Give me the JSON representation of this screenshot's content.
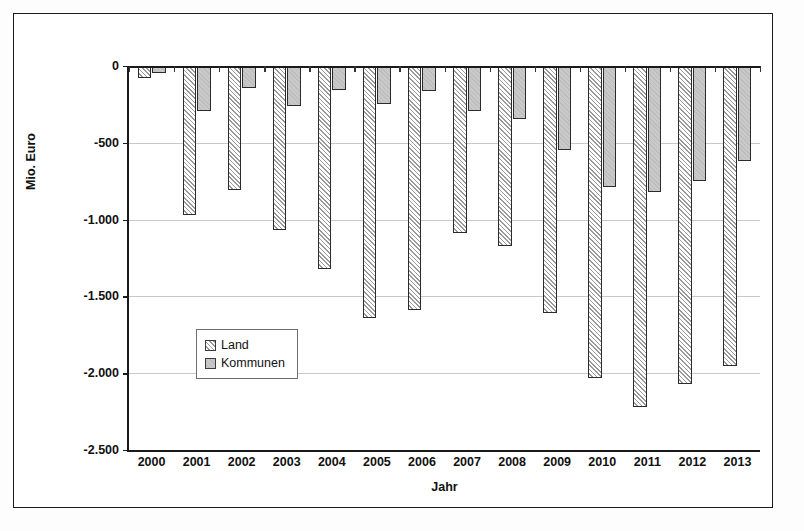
{
  "chart_data": {
    "type": "bar",
    "title": "",
    "xlabel": "Jahr",
    "ylabel": "Mio. Euro",
    "categories": [
      "2000",
      "2001",
      "2002",
      "2003",
      "2004",
      "2005",
      "2006",
      "2007",
      "2008",
      "2009",
      "2010",
      "2011",
      "2012",
      "2013"
    ],
    "series": [
      {
        "name": "Land",
        "color": "#fafafa",
        "pattern": "diagonal-hatch",
        "values": [
          -80,
          -970,
          -810,
          -1070,
          -1320,
          -1640,
          -1590,
          -1090,
          -1170,
          -1610,
          -2030,
          -2220,
          -2070,
          -1950
        ]
      },
      {
        "name": "Kommunen",
        "color": "#c8c8c8",
        "pattern": "solid-gray",
        "values": [
          -45,
          -290,
          -140,
          -260,
          -155,
          -250,
          -165,
          -295,
          -345,
          -545,
          -790,
          -820,
          -750,
          -620
        ]
      }
    ],
    "ylim": [
      -2500,
      0
    ],
    "yticks": [
      0,
      -500,
      -1000,
      -1500,
      -2000,
      -2500
    ],
    "ytick_labels": [
      "0",
      "-500",
      "-1.000",
      "-1.500",
      "-2.000",
      "-2.500"
    ],
    "grid": true,
    "legend_position": "inside-lower-left",
    "orientation": "vertical-downward"
  },
  "legend": {
    "items": [
      {
        "label": "Land"
      },
      {
        "label": "Kommunen"
      }
    ]
  },
  "axes": {
    "y_title": "Mio. Euro",
    "x_title": "Jahr"
  }
}
